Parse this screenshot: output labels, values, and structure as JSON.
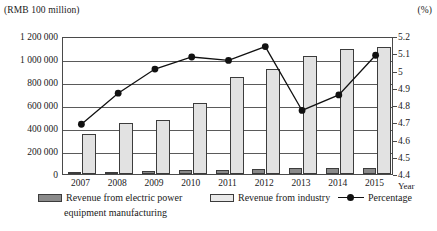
{
  "axes": {
    "left_unit": "(RMB 100 million)",
    "right_unit": "(%)",
    "x_title": "Year",
    "left_ticks": [
      "1 200 000",
      "1 000 000",
      "800 000",
      "600 000",
      "400 000",
      "200 000",
      "0"
    ],
    "right_ticks": [
      "5.2",
      "5.1",
      "5",
      "4.9",
      "4.8",
      "4.7",
      "4.6",
      "4.5",
      "4.4"
    ]
  },
  "legend": {
    "equip_line1": "Revenue from electric power",
    "equip_line2": "equipment manufacturing",
    "industry": "Revenue from industry",
    "percentage": "Percentage"
  },
  "colors": {
    "industry_bar": "#e2e2e2",
    "equip_bar": "#8a8a8a",
    "line": "#111111",
    "axis": "#4a4a4a",
    "grid": "#5a5a5a"
  },
  "chart_data": {
    "type": "bar",
    "title": "",
    "subtitle": "",
    "xlabel": "Year",
    "ylabel": "(RMB 100 million)",
    "y2label": "(%)",
    "grid": true,
    "legend_position": "bottom",
    "categories": [
      "2007",
      "2008",
      "2009",
      "2010",
      "2011",
      "2012",
      "2013",
      "2014",
      "2015"
    ],
    "ylim": [
      0,
      1200000
    ],
    "ytick_values": [
      0,
      200000,
      400000,
      600000,
      800000,
      1000000,
      1200000
    ],
    "y2lim": [
      4.4,
      5.2
    ],
    "y2tick_values": [
      4.4,
      4.5,
      4.6,
      4.7,
      4.8,
      4.9,
      5.0,
      5.1,
      5.2
    ],
    "series": [
      {
        "name": "Revenue from electric power equipment manufacturing",
        "type": "bar",
        "axis": "left",
        "values": [
          18000,
          20000,
          24000,
          33000,
          38000,
          43000,
          48000,
          50000,
          55000
        ]
      },
      {
        "name": "Revenue from industry",
        "type": "bar",
        "axis": "left",
        "values": [
          350000,
          440000,
          470000,
          620000,
          840000,
          910000,
          1030000,
          1090000,
          1105000
        ]
      },
      {
        "name": "Percentage",
        "type": "line",
        "axis": "right",
        "values": [
          4.7,
          4.88,
          5.02,
          5.09,
          5.07,
          5.15,
          4.78,
          4.87,
          5.1
        ]
      }
    ]
  }
}
